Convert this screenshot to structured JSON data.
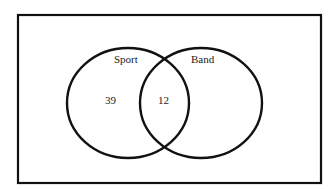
{
  "diagram": {
    "type": "venn",
    "sets": [
      {
        "label": "Sport",
        "only_count": "39"
      },
      {
        "label": "Band",
        "only_count": ""
      }
    ],
    "intersection": {
      "label": "Sport ∩ Band",
      "count": "12"
    },
    "colors": {
      "stroke": "#111111",
      "background": "#ffffff"
    }
  }
}
